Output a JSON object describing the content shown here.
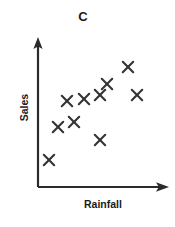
{
  "chart_data": {
    "type": "scatter",
    "title": "C",
    "xlabel": "Rainfall",
    "ylabel": "Sales",
    "grid": false,
    "legend": null,
    "axis_style": "arrow",
    "xlim": [
      0,
      10
    ],
    "ylim": [
      0,
      10
    ],
    "tick_labels": {
      "x": [],
      "y": []
    },
    "marker": "x",
    "marker_color": "#333333",
    "series": [
      {
        "name": "Sales vs Rainfall",
        "points": [
          {
            "x": 0.9,
            "y": 1.9
          },
          {
            "x": 1.7,
            "y": 4.2
          },
          {
            "x": 2.3,
            "y": 5.4
          },
          {
            "x": 2.8,
            "y": 6.6
          },
          {
            "x": 4.0,
            "y": 7.0
          },
          {
            "x": 4.9,
            "y": 3.4
          },
          {
            "x": 5.5,
            "y": 7.9
          },
          {
            "x": 7.1,
            "y": 9.2
          },
          {
            "x": 7.8,
            "y": 6.4
          },
          {
            "x": 3.4,
            "y": 7.1
          }
        ]
      }
    ],
    "relationship": "positive correlation"
  },
  "axes": {
    "origin": {
      "x": 38,
      "y": 187
    },
    "y_top": {
      "x": 38,
      "y": 38
    },
    "x_right": {
      "x": 168,
      "y": 187
    },
    "color": "#2b2b2b",
    "width": 2
  },
  "markers_px": [
    {
      "cx": 49,
      "cy": 160
    },
    {
      "cx": 58,
      "cy": 127
    },
    {
      "cx": 67,
      "cy": 101
    },
    {
      "cx": 74,
      "cy": 122
    },
    {
      "cx": 84,
      "cy": 99
    },
    {
      "cx": 100,
      "cy": 140
    },
    {
      "cx": 100,
      "cy": 95
    },
    {
      "cx": 107,
      "cy": 84
    },
    {
      "cx": 128,
      "cy": 67
    },
    {
      "cx": 137,
      "cy": 95
    }
  ]
}
